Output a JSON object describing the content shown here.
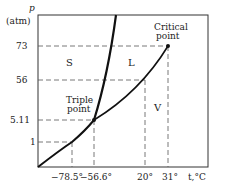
{
  "diagram": {
    "y_axis": {
      "symbol": "p",
      "unit": "(atm)"
    },
    "x_axis": {
      "label": "t,°C"
    },
    "y_ticks": [
      "73",
      "56",
      "5.11",
      "1"
    ],
    "x_ticks": [
      "−78.5°",
      "−56.6°",
      "20°",
      "31°"
    ],
    "regions": {
      "solid": "S",
      "liquid": "L",
      "vapor": "V"
    },
    "points": {
      "critical": {
        "line1": "Critical",
        "line2": "point"
      },
      "triple": {
        "line1": "Triple",
        "line2": "point"
      }
    },
    "colors": {
      "curve": "#111111",
      "axis": "#333333",
      "dashed": "#555555"
    }
  }
}
